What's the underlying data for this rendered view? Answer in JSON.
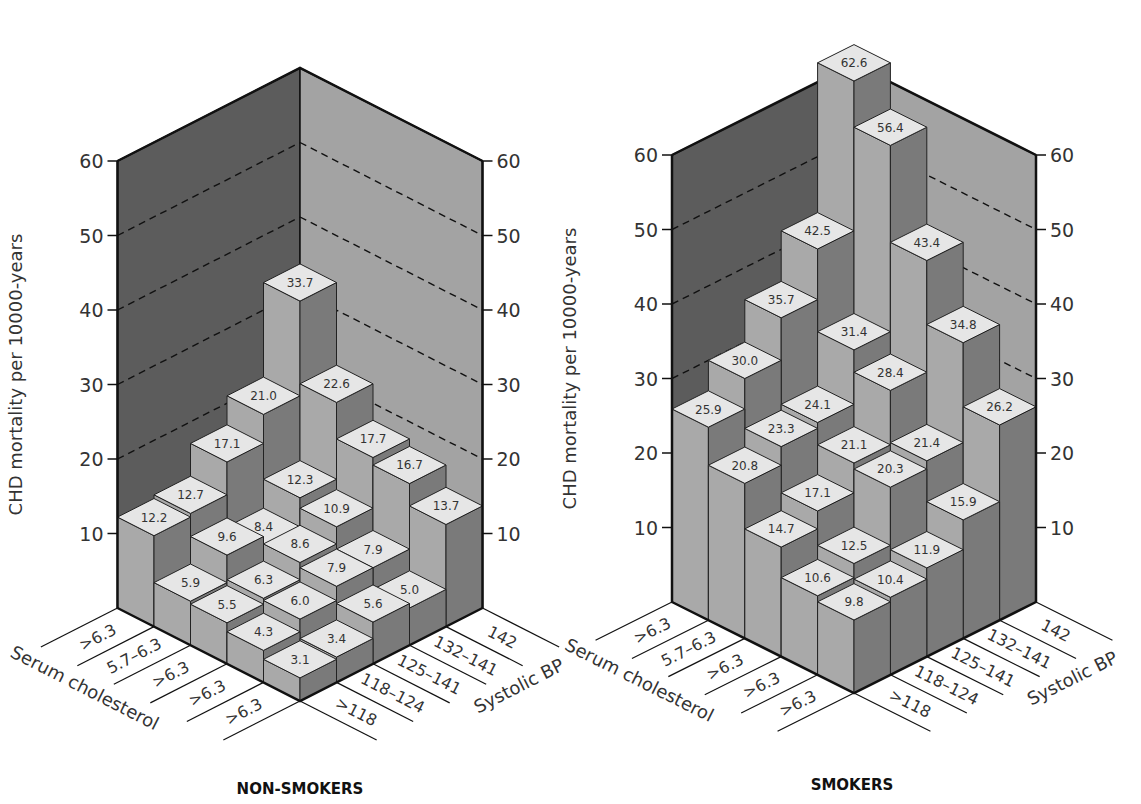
{
  "figure": {
    "colors": {
      "bar_top": "#e6e6e6",
      "bar_left": "#a9a9a9",
      "bar_right": "#7a7a7a",
      "wall_left": "#5c5c5c",
      "wall_right": "#a3a3a3",
      "outline": "#111111"
    }
  },
  "chart_data": [
    {
      "type": "bar3d",
      "title": "NON-SMOKERS",
      "ylabel": "CHD mortality per 10000-years",
      "xlabel": "Serum cholesterol",
      "zlabel": "Systolic BP",
      "ylim": [
        0,
        60
      ],
      "yticks": [
        10,
        20,
        30,
        40,
        50,
        60
      ],
      "gridlines": [
        20,
        30,
        40,
        50
      ],
      "cholesterol_categories": [
        ">6.3",
        "5.7–6.3",
        ">6.3",
        ">6.3",
        ">6.3"
      ],
      "bp_categories": [
        ">118",
        "118–124",
        "125–141",
        "132–141",
        "142"
      ],
      "values": [
        [
          12.2,
          12.7,
          17.1,
          21.0,
          33.7
        ],
        [
          5.9,
          9.6,
          8.4,
          12.3,
          22.6
        ],
        [
          5.5,
          6.3,
          8.6,
          10.9,
          17.7
        ],
        [
          4.3,
          6.0,
          7.9,
          7.9,
          16.7
        ],
        [
          3.1,
          3.4,
          5.6,
          5.0,
          13.7
        ]
      ],
      "labels": [
        [
          "12.2",
          "12.7",
          "17.1",
          "21.0",
          "33.7"
        ],
        [
          "5.9",
          "9.6",
          "8.4",
          "12.3",
          "22.6"
        ],
        [
          "5.5",
          "6.3",
          "8.6",
          "10.9",
          "17.7"
        ],
        [
          "4.3",
          "6.0",
          "7.9",
          "7.9",
          "16.7"
        ],
        [
          "3.1",
          "3.4",
          "5.6",
          "5.0",
          "13.7"
        ]
      ]
    },
    {
      "type": "bar3d",
      "title": "SMOKERS",
      "ylabel": "CHD mortality per 10000-years",
      "xlabel": "Serum cholesterol",
      "zlabel": "Systolic BP",
      "ylim": [
        0,
        60
      ],
      "yticks": [
        10,
        20,
        30,
        40,
        50,
        60
      ],
      "gridlines": [
        20,
        30,
        40,
        50
      ],
      "cholesterol_categories": [
        ">6.3",
        "5.7–6.3",
        ">6.3",
        ">6.3",
        ">6.3"
      ],
      "bp_categories": [
        ">118",
        "118–124",
        "125–141",
        "132–141",
        "142"
      ],
      "values": [
        [
          25.9,
          30.0,
          35.7,
          42.5,
          62.6
        ],
        [
          20.8,
          23.3,
          24.1,
          31.4,
          56.4
        ],
        [
          14.7,
          17.1,
          21.1,
          28.4,
          43.4
        ],
        [
          10.6,
          12.5,
          20.3,
          21.4,
          34.8
        ],
        [
          9.8,
          10.4,
          11.9,
          15.9,
          26.2
        ]
      ],
      "labels": [
        [
          "25.9",
          "30.0",
          "35.7",
          "42.5",
          "62.6"
        ],
        [
          "20.8",
          "23.3",
          "24.1",
          "31.4",
          "56.4"
        ],
        [
          "14.7",
          "17.1",
          "21.1",
          "28.4",
          "43.4"
        ],
        [
          "10.6",
          "12.5",
          "20.3",
          "21.4",
          "34.8"
        ],
        [
          "9.8",
          "10.4",
          "11.9",
          "15.9",
          "26.2"
        ]
      ]
    }
  ]
}
